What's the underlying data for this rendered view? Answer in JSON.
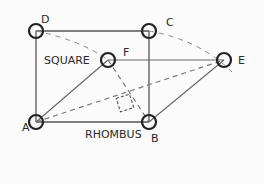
{
  "diagram": {
    "shapes": [
      {
        "name": "SQUARE",
        "vertices": [
          "A",
          "B",
          "C",
          "D"
        ]
      },
      {
        "name": "RHOMBUS",
        "vertices": [
          "A",
          "B",
          "E",
          "F"
        ]
      }
    ],
    "labels": {
      "A": "A",
      "B": "B",
      "C": "C",
      "D": "D",
      "E": "E",
      "F": "F",
      "square": "SQUARE",
      "rhombus": "RHOMBUS"
    },
    "points": {
      "A": [
        36,
        122
      ],
      "B": [
        149,
        122
      ],
      "C": [
        149,
        31
      ],
      "D": [
        36,
        31
      ],
      "E": [
        224,
        60
      ],
      "F": [
        108,
        60
      ]
    },
    "colors": {
      "stroke": "#555555",
      "circle": "#222222",
      "dashed": "#7a7a7a",
      "text": "#2a2a2a"
    }
  }
}
